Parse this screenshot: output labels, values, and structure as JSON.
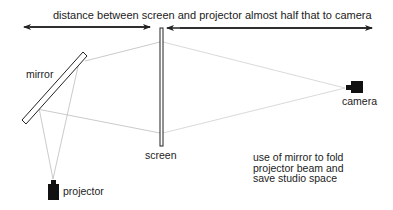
{
  "diagram": {
    "title": "distance between screen and projector almost half that to camera",
    "labels": {
      "mirror": "mirror",
      "screen": "screen",
      "projector": "projector",
      "camera": "camera"
    },
    "note": {
      "lines": [
        "use of mirror to fold",
        "projector beam and",
        "save studio space"
      ]
    },
    "colors": {
      "line": "#222222",
      "beam": "#b8b8b8",
      "device": "#111111",
      "background": "#ffffff"
    },
    "elements": [
      {
        "type": "projector",
        "icon": "projector-icon"
      },
      {
        "type": "mirror",
        "icon": "mirror-icon"
      },
      {
        "type": "screen",
        "icon": "screen-icon"
      },
      {
        "type": "camera",
        "icon": "camera-icon"
      }
    ]
  }
}
